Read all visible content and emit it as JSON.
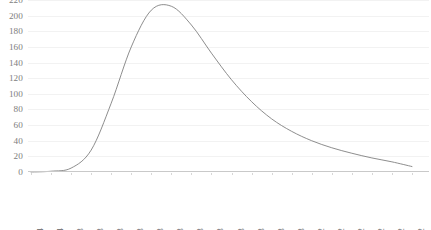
{
  "chart_data": {
    "type": "line",
    "title": "",
    "subtitle": "",
    "xlabel": "",
    "ylabel": "",
    "grid": true,
    "legend": false,
    "ylim": [
      0,
      220
    ],
    "y_ticks": [
      0,
      20,
      40,
      60,
      80,
      100,
      120,
      140,
      160,
      180,
      200,
      220
    ],
    "y_tick_labels": [
      "0",
      "20",
      "40",
      "60",
      "80",
      "100",
      "120",
      "140",
      "160",
      "180",
      "200",
      "220"
    ],
    "categories": [
      "2,186E-04",
      "9,475E-04",
      "1,676E-03",
      "2,405E-03",
      "3,134E-03",
      "3,863E-03",
      "4,592E-03",
      "5,320E-03",
      "6,049E-03",
      "6,778E-03",
      "7,507E-03",
      "8,236E-03",
      "8,964E-03",
      "9,693E-03",
      "1,042E-02",
      "1,115E-02",
      "1,188E-02",
      "1,261E-02",
      "1,334E-02",
      "1,407E-02"
    ],
    "x": [
      0.0002186,
      0.0009475,
      0.001676,
      0.002405,
      0.003134,
      0.003863,
      0.004592,
      0.00532,
      0.006049,
      0.006778,
      0.007507,
      0.008236,
      0.008964,
      0.009693,
      0.01042,
      0.01115,
      0.01188,
      0.01261,
      0.01334,
      0.01407
    ],
    "values": [
      0,
      1,
      5,
      28,
      88,
      160,
      207,
      212,
      188,
      152,
      118,
      90,
      68,
      52,
      40,
      31,
      24,
      18,
      13,
      7
    ],
    "series": [
      {
        "name": "distribution",
        "color": "#808080",
        "values": [
          0,
          1,
          5,
          28,
          88,
          160,
          207,
          212,
          188,
          152,
          118,
          90,
          68,
          52,
          40,
          31,
          24,
          18,
          13,
          7
        ]
      }
    ],
    "peak_value": 213,
    "peak_category": "5,320E-03",
    "colors": {
      "curve": "#808080",
      "gridline": "#f2f2f2",
      "axis": "#c9c9c9",
      "tick_text": "#7d7d7d",
      "background": "#ffffff"
    }
  }
}
